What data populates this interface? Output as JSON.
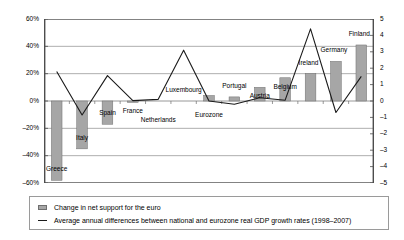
{
  "chart_data": {
    "type": "bar",
    "title": "",
    "subtitle": "",
    "xlabel": "",
    "ylabel": "",
    "grid": true,
    "legend_position": "bottom",
    "categories": [
      "Greece",
      "Italy",
      "Spain",
      "France",
      "Netherlands",
      "Luxembourg",
      "Eurozone",
      "Portugal",
      "Austria",
      "Belgium",
      "Ireland",
      "Germany",
      "Finland"
    ],
    "axes": {
      "left": {
        "label": "",
        "ylim": [
          -60,
          60
        ],
        "ticks": [
          60,
          40,
          20,
          0,
          -20,
          -40,
          -60
        ],
        "tick_labels": [
          "60%",
          "40%",
          "20%",
          "0%",
          "–20%",
          "–40%",
          "–60%"
        ]
      },
      "right": {
        "label": "",
        "ylim": [
          -5,
          5
        ],
        "ticks": [
          5,
          4,
          3,
          2,
          1,
          0,
          -1,
          -2,
          -3,
          -4,
          -5
        ],
        "tick_labels": [
          "5",
          "4",
          "3",
          "2",
          "1",
          "0",
          "–1",
          "–2",
          "–3",
          "–4",
          "–5"
        ]
      }
    },
    "series": [
      {
        "name": "Change in net support for the euro",
        "type": "bar",
        "axis": "left",
        "unit": "%",
        "color": "#a6a6a6",
        "edge_color": "#6f6f6f",
        "values": [
          -58,
          -35,
          -17,
          -1,
          0,
          0,
          4,
          3,
          10,
          17,
          20,
          29,
          41
        ]
      },
      {
        "name": "Average annual differences between national and eurozone real GDP growth rates (1998–2007)",
        "type": "line",
        "axis": "right",
        "unit": "pp",
        "color": "#1a1a1a",
        "values": [
          1.8,
          -0.85,
          1.55,
          0.02,
          0.1,
          3.1,
          0.0,
          -0.2,
          0.2,
          0.05,
          4.4,
          -0.7,
          1.5
        ]
      }
    ]
  },
  "legend": {
    "items": [
      {
        "label": "Change in net support for the euro",
        "marker": "bar-swatch"
      },
      {
        "label": "Average annual differences between national and eurozone real GDP growth rates (1998–2007)",
        "marker": "line-swatch"
      }
    ]
  }
}
